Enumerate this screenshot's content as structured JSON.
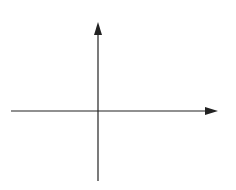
{
  "chart_data": {
    "type": "line",
    "title": "",
    "xlabel": "x",
    "ylabel": "y",
    "xlim": [
      -5,
      7
    ],
    "ylim": [
      -4,
      6
    ],
    "grid": true,
    "grid_step": 1,
    "tick_labels": false,
    "series": [
      {
        "name": "f(x)",
        "color": "#7a7a7a",
        "points": [
          {
            "x": -3,
            "y": -2,
            "marker": true
          },
          {
            "x": -2,
            "y": 0,
            "marker": false
          },
          {
            "x": 0,
            "y": 1.6,
            "marker": false
          },
          {
            "x": 1,
            "y": 2,
            "marker": true
          },
          {
            "x": 3,
            "y": -1,
            "marker": true
          },
          {
            "x": 4,
            "y": 1,
            "marker": true
          }
        ]
      }
    ],
    "key_points": {
      "start": {
        "x": -3,
        "y": -2
      },
      "local_max": {
        "x": 1,
        "y": 2
      },
      "local_min": {
        "x": 3,
        "y": -1
      },
      "end": {
        "x": 4,
        "y": 1
      }
    }
  },
  "axes": {
    "x_label": "x",
    "y_label": "y"
  },
  "colors": {
    "grid": "#cfcfcf",
    "axis": "#222222",
    "curve": "#7a7a7a",
    "marker": "#6e6e6e"
  }
}
